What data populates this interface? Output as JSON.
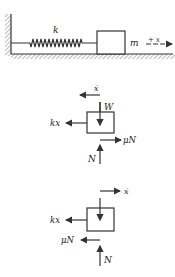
{
  "system": {
    "spring_label": "k",
    "mass_label": "m",
    "direction_label": "+ x"
  },
  "fbd_moving_left": {
    "velocity_label": "ẋ",
    "velocity_direction": "left",
    "weight_label": "W",
    "spring_force_label": "kx",
    "friction_label": "μN",
    "friction_direction": "right",
    "normal_label": "N"
  },
  "fbd_moving_right": {
    "velocity_label": "ẋ",
    "velocity_direction": "right",
    "spring_force_label": "kx",
    "friction_label": "μN",
    "friction_direction": "left",
    "normal_label": "N"
  },
  "colors": {
    "ink": "#333333",
    "background": "#ffffff"
  }
}
